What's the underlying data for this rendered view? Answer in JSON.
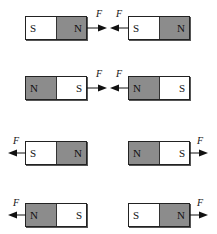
{
  "force_label": "F",
  "colors": {
    "north": "#8c8c8c",
    "south": "#ffffff",
    "outline": "#222222"
  },
  "rows": [
    {
      "left": {
        "poles": [
          "S",
          "N"
        ],
        "x": 25,
        "y": 16
      },
      "right": {
        "poles": [
          "S",
          "N"
        ],
        "x": 128,
        "y": 16
      },
      "forces": "attract"
    },
    {
      "left": {
        "poles": [
          "N",
          "S"
        ],
        "x": 25,
        "y": 76
      },
      "right": {
        "poles": [
          "N",
          "S"
        ],
        "x": 128,
        "y": 76
      },
      "forces": "attract"
    },
    {
      "left": {
        "poles": [
          "S",
          "N"
        ],
        "x": 25,
        "y": 141
      },
      "right": {
        "poles": [
          "N",
          "S"
        ],
        "x": 128,
        "y": 141
      },
      "forces": "repel"
    },
    {
      "left": {
        "poles": [
          "N",
          "S"
        ],
        "x": 25,
        "y": 203
      },
      "right": {
        "poles": [
          "S",
          "N"
        ],
        "x": 128,
        "y": 203
      },
      "forces": "repel"
    }
  ]
}
